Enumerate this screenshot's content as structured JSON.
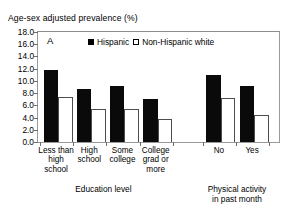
{
  "chart_data": {
    "type": "bar",
    "title": "Age-sex adjusted prevalence (%)",
    "panel_label": "A",
    "ylabel": "Age-sex adjusted prevalence (%)",
    "xlabel": "",
    "ylim": [
      0.0,
      18.0
    ],
    "ytick_step": 2.0,
    "yticks": [
      "0.0",
      "2.0",
      "4.0",
      "6.0",
      "8.0",
      "10.0",
      "12.0",
      "14.0",
      "16.0",
      "18.0"
    ],
    "ytick_values": [
      0.0,
      2.0,
      4.0,
      6.0,
      8.0,
      10.0,
      12.0,
      14.0,
      16.0,
      18.0
    ],
    "grid": false,
    "legend_position": "top-center",
    "categories": [
      "Less than\nhigh school",
      "High\nschool",
      "Some\ncollege",
      "College\ngrad or\nmore",
      "No",
      "Yes"
    ],
    "series": [
      {
        "name": "Hispanic",
        "marker": "filled-square",
        "color": "#000000",
        "values": [
          11.8,
          8.6,
          9.2,
          7.0,
          10.9,
          9.2
        ]
      },
      {
        "name": "Non-Hispanic white",
        "marker": "open-square",
        "color": "#ffffff",
        "values": [
          7.4,
          5.4,
          5.4,
          3.8,
          7.2,
          4.5
        ]
      }
    ],
    "groups": [
      {
        "title": "Education level",
        "categories": [
          0,
          1,
          2,
          3
        ]
      },
      {
        "title": "Physical activity\nin past month",
        "categories": [
          4,
          5
        ]
      }
    ]
  },
  "axis_titles": {
    "education": "Education level",
    "activity": "Physical activity\nin past month"
  }
}
